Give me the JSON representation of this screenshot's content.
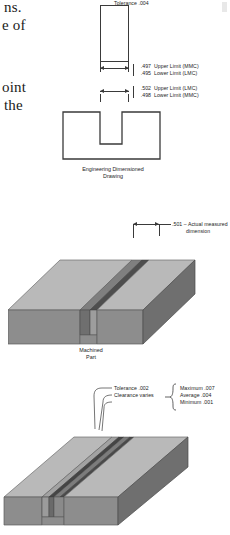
{
  "page_text_fragments": [
    {
      "text": "ns.",
      "x": 4,
      "y": 2
    },
    {
      "text": "e of",
      "x": 2,
      "y": 20
    },
    {
      "text": "oint",
      "x": 2,
      "y": 82
    },
    {
      "text": "the",
      "x": 4,
      "y": 100
    }
  ],
  "figure1": {
    "caption_line1": "Engineering Dimensioned",
    "caption_line2": "Drawing",
    "shaft_limits": [
      {
        "value": ".497",
        "label": "Upper Limit (MMC)"
      },
      {
        "value": ".495",
        "label": "Lower Limit (LMC)"
      }
    ],
    "slot_limits": [
      {
        "value": ".502",
        "label": "Upper Limit (LMC)"
      },
      {
        "value": ".498",
        "label": "Lower Limit (MMC)"
      }
    ]
  },
  "figure2": {
    "caption_line1": "Machined",
    "caption_line2": "Part",
    "annotation_value": ".501",
    "annotation_dash": "–",
    "annotation_line1": "Actual measured",
    "annotation_line2": "dimension"
  },
  "figure3": {
    "tolerance_notes": [
      "Tolerance .002",
      "Clearance varies",
      "Tolerance .004"
    ],
    "clearance_range": [
      "Maximum .007",
      "Average .004",
      "Minimum .001"
    ]
  },
  "colors": {
    "line": "#3a3a3a",
    "top_face": "#b9b9b9",
    "front_face": "#8d8d8d",
    "side_face": "#6f6f6f",
    "groove_dark": "#4a4a4a",
    "groove_mid": "#7a7a7a",
    "paper": "#ffffff"
  }
}
